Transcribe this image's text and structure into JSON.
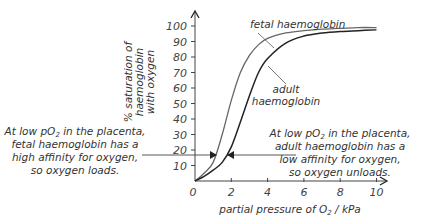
{
  "chart_data": {
    "type": "line",
    "title": "",
    "xlabel": "partial pressure of O2 / kPa",
    "ylabel": "% saturation of haemoglobin with oxygen",
    "xlim": [
      0,
      10
    ],
    "ylim": [
      0,
      100
    ],
    "x_ticks": [
      "0",
      "2",
      "4",
      "6",
      "8",
      "10"
    ],
    "y_ticks": [
      "10",
      "20",
      "30",
      "40",
      "50",
      "60",
      "70",
      "80",
      "90",
      "100"
    ],
    "grid": false,
    "series": [
      {
        "name": "fetal haemoglobin",
        "color": "#666666",
        "x": [
          0,
          0.5,
          1,
          1.5,
          2,
          2.5,
          3,
          3.5,
          4,
          5,
          6,
          7,
          8,
          9,
          10
        ],
        "values": [
          0,
          5,
          12,
          30,
          52,
          70,
          81,
          88,
          92,
          95.5,
          97,
          98,
          98.5,
          99,
          99
        ]
      },
      {
        "name": "adult haemoglobin",
        "color": "#222222",
        "x": [
          0,
          0.5,
          1,
          1.5,
          2,
          2.5,
          3,
          3.5,
          4,
          5,
          6,
          7,
          8,
          9,
          10
        ],
        "values": [
          0,
          3,
          7,
          12,
          22,
          38,
          55,
          70,
          79,
          89,
          93.5,
          95.5,
          96.5,
          97,
          97.5
        ]
      }
    ],
    "annotations": [
      {
        "text_lines": [
          "At low pO2 in the placenta,",
          "fetal haemoglobin has a",
          "high affinity for oxygen,",
          "so oxygen loads."
        ],
        "arrow_to": "fetal haemoglobin at ~16%"
      },
      {
        "text_lines": [
          "At low pO2 in the placenta,",
          "adult haemoglobin has a",
          "low affinity for oxygen,",
          "so oxygen unloads."
        ],
        "arrow_to": "adult haemoglobin at ~16%"
      }
    ]
  },
  "labels": {
    "y_axis_line1": "% saturation of",
    "y_axis_line2": "haemoglobin",
    "y_axis_line3": "with oxygen",
    "x_axis_prefix": "partial pressure of O",
    "x_axis_sub": "2",
    "x_axis_suffix": " / kPa",
    "fetal_label": "fetal haemoglobin",
    "adult_label_line1": "adult",
    "adult_label_line2": "haemoglobin",
    "left_ann": {
      "l1_pre": "At low pO",
      "l1_sub": "2",
      "l1_post": " in the placenta,",
      "l2": "fetal haemoglobin has a",
      "l3": "high affinity for oxygen,",
      "l4": "so oxygen loads."
    },
    "right_ann": {
      "l1_pre": "At low pO",
      "l1_sub": "2",
      "l1_post": " in the placenta,",
      "l2": "adult haemoglobin has a",
      "l3": "low affinity for oxygen,",
      "l4": "so oxygen unloads."
    }
  }
}
